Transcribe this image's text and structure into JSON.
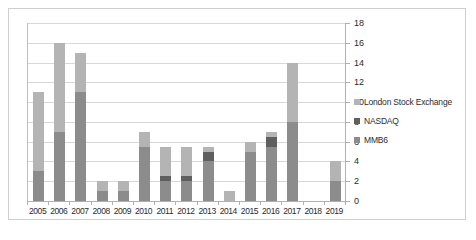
{
  "chart_data": {
    "type": "bar",
    "stacked": true,
    "title": "",
    "xlabel": "",
    "ylabel": "",
    "ylim": [
      0,
      18
    ],
    "ytick_step": 2,
    "grid": true,
    "legend_position": "right",
    "categories": [
      "2005",
      "2006",
      "2007",
      "2008",
      "2009",
      "2010",
      "2011",
      "2012",
      "2013",
      "2014",
      "2015",
      "2016",
      "2017",
      "2018",
      "2019"
    ],
    "yticks": [
      "18",
      "16",
      "14",
      "12",
      "10",
      "8",
      "6",
      "4",
      "2",
      "0"
    ],
    "series": [
      {
        "name": "MMB6",
        "color": "#8c8c8c",
        "values": [
          3,
          7,
          11,
          1,
          1,
          5.5,
          2,
          2,
          4,
          0,
          5,
          5.5,
          8,
          0,
          2
        ]
      },
      {
        "name": "NASDAQ",
        "color": "#5f5f5f",
        "values": [
          0,
          0,
          0,
          0,
          0,
          0,
          0.5,
          0.5,
          1,
          0,
          0,
          1,
          0,
          0,
          0
        ]
      },
      {
        "name": "London Stock Exchange",
        "color": "#b4b4b4",
        "values": [
          8,
          9,
          4,
          1,
          1,
          1.5,
          3,
          3,
          0.5,
          1,
          1,
          0.5,
          6,
          0,
          2
        ]
      }
    ],
    "totals": [
      11,
      16,
      15,
      2,
      2,
      7,
      5.5,
      5.5,
      5.5,
      1,
      6,
      7,
      14,
      0,
      4
    ]
  },
  "legend": {
    "items": [
      {
        "label": "London Stock Exchange",
        "color": "#b4b4b4"
      },
      {
        "label": "NASDAQ",
        "color": "#5f5f5f"
      },
      {
        "label": "MMB6",
        "color": "#8c8c8c"
      }
    ]
  }
}
